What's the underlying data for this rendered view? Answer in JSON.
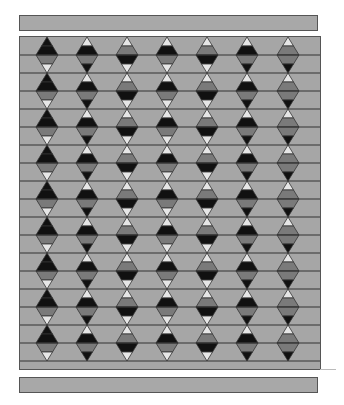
{
  "diagram": {
    "title": "",
    "colors": {
      "background": "#a6a6a6",
      "black": "#111111",
      "gray": "#7a7a7a",
      "light": "#e6e6e6",
      "line": "#333333",
      "bar": "#a8a8a8"
    },
    "frame": {
      "x": 19,
      "y": 36,
      "width": 302,
      "height": 334
    },
    "row_height": 18,
    "diamond_half_width": 11,
    "diamond_half_height": 18,
    "first_center_y": 18,
    "diamond_rows": 9,
    "columns": [
      {
        "cx": 27,
        "parts": [
          "black",
          "black",
          "gray",
          "light"
        ]
      },
      {
        "cx": 67,
        "parts": [
          "light",
          "black",
          "gray",
          "black"
        ]
      },
      {
        "cx": 107,
        "parts": [
          "light",
          "gray",
          "black",
          "light"
        ]
      },
      {
        "cx": 147,
        "parts": [
          "light",
          "black",
          "gray",
          "light"
        ]
      },
      {
        "cx": 187,
        "parts": [
          "light",
          "gray",
          "black",
          "light"
        ]
      },
      {
        "cx": 227,
        "parts": [
          "light",
          "black",
          "gray",
          "black"
        ]
      },
      {
        "cx": 268,
        "parts": [
          "light",
          "gray",
          "gray",
          "black"
        ]
      }
    ]
  }
}
